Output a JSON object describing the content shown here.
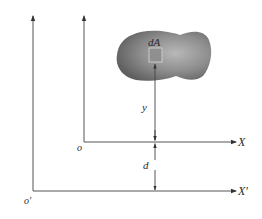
{
  "diagram": {
    "type": "parallel-axis-theorem",
    "labels": {
      "element": "dA",
      "distance_y": "y",
      "distance_d": "d",
      "origin": "o",
      "origin_prime": "o′",
      "axis_x": "X",
      "axis_x_prime": "X′"
    },
    "colors": {
      "axis": "#555555",
      "shape_dark": "#6e6e6e",
      "shape_light": "#b5b5b5",
      "element_fill": "#8f8f8f",
      "element_stroke": "#d8d8d8",
      "text": "#2a2a2a"
    }
  }
}
